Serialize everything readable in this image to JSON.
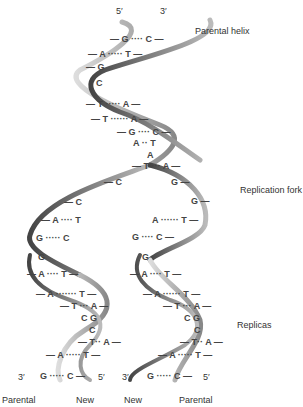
{
  "diagram": {
    "type": "DNA replication fork",
    "labels": {
      "parental_helix": "Parental helix",
      "replication_fork": "Replication fork",
      "replicas": "Replicas"
    },
    "top_ends": {
      "left": "5′",
      "right": "3′"
    },
    "bottom_ends": {
      "left_replica": {
        "left": "3′",
        "right": "5′"
      },
      "right_replica": {
        "left": "3′",
        "right": "5′"
      }
    },
    "bottom_labels": [
      "Parental",
      "New",
      "New",
      "Parental"
    ],
    "parental_pairs": [
      "— G ···· C —",
      "— A ····· T —",
      "— G",
      "C",
      "— T ····· A —",
      "— T ······ A —",
      "— G ···· C —",
      "A ·· T",
      "A",
      "— T ··· A —"
    ],
    "fork_bases": {
      "left": [
        "— C",
        "— C",
        "— A ···· T",
        "G ····· C"
      ],
      "right": [
        "G —",
        "G —",
        "A ······ T —",
        "G ···· C —"
      ]
    },
    "left_replica_pairs": [
      "G",
      "— A ···· T —",
      "— A ······· T —",
      "— T ··· A —",
      "C G",
      "C",
      "— T·· A —",
      "— A ····· T —",
      "G ····· C —"
    ],
    "right_replica_pairs": [
      "G",
      "— A ···· T —",
      "— A ······ T —",
      "— T ··· A —",
      "C G",
      "C",
      "— T·· A —",
      "— A ····· T —",
      "G ····· C —"
    ],
    "colors": {
      "strand_dark": "#555555",
      "strand_light": "#c8c8c8",
      "text": "#333333"
    }
  }
}
